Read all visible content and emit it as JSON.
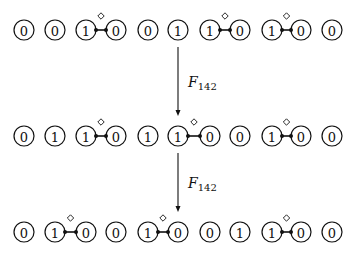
{
  "diagram": {
    "cell_x": [
      24,
      55,
      86,
      116,
      148,
      178,
      210,
      240,
      272,
      301,
      332
    ],
    "radius": 10,
    "rows": [
      {
        "y": 30,
        "values": [
          "0",
          "0",
          "1",
          "0",
          "0",
          "1",
          "1",
          "0",
          "1",
          "0",
          "0"
        ],
        "bonds": [
          [
            2,
            3
          ],
          [
            6,
            7
          ],
          [
            8,
            9
          ]
        ]
      },
      {
        "y": 136,
        "values": [
          "0",
          "1",
          "1",
          "0",
          "1",
          "1",
          "0",
          "0",
          "1",
          "0",
          "0"
        ],
        "bonds": [
          [
            2,
            3
          ],
          [
            5,
            6
          ],
          [
            8,
            9
          ]
        ]
      },
      {
        "y": 232,
        "values": [
          "0",
          "1",
          "0",
          "0",
          "1",
          "0",
          "0",
          "1",
          "1",
          "0",
          "0"
        ],
        "bonds": [
          [
            1,
            2
          ],
          [
            4,
            5
          ],
          [
            8,
            9
          ]
        ]
      }
    ],
    "arrows": [
      {
        "x": 178,
        "y1": 47,
        "y2": 116,
        "label": "F",
        "subscript": "142"
      },
      {
        "x": 178,
        "y1": 153,
        "y2": 212,
        "label": "F",
        "subscript": "142"
      }
    ]
  }
}
